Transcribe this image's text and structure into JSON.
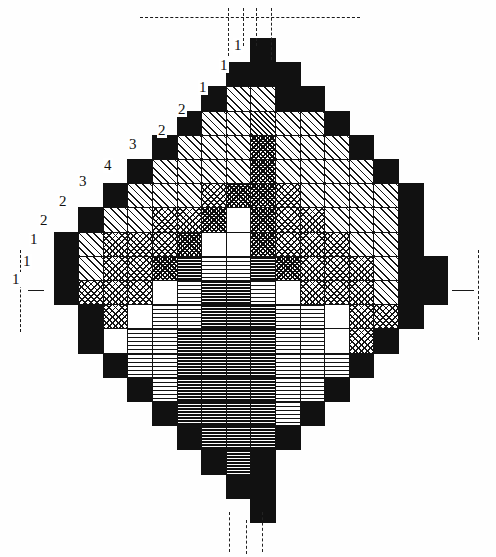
{
  "figure": {
    "kind": "reactor-core-cross-section",
    "title": "",
    "width": 496,
    "height": 557,
    "background": "#ffffff",
    "ink": "#111111"
  },
  "geometry": {
    "cell_w": 24.6,
    "cell_h": 24.2,
    "origin_x": 29,
    "origin_y": 38,
    "cols": 18,
    "rows": 21
  },
  "legend_patterns": [
    {
      "key": "black",
      "name": "solid-black",
      "css": "p-black"
    },
    {
      "key": "white",
      "name": "blank-white",
      "css": "p-white"
    },
    {
      "key": "diag",
      "name": "diagonal-hatch",
      "css": "p-diag"
    },
    {
      "key": "diag2",
      "name": "dense-diagonal",
      "css": "p-diag2"
    },
    {
      "key": "cross",
      "name": "cross-hatch",
      "css": "p-cross"
    },
    {
      "key": "cross2",
      "name": "dense-cross-hatch",
      "css": "p-cross2"
    },
    {
      "key": "horiz",
      "name": "horizontal-rule",
      "css": "p-horiz"
    },
    {
      "key": "horiz2",
      "name": "dense-horizontal",
      "css": "p-horiz2"
    }
  ],
  "callouts": [
    {
      "label": "1",
      "x": 233,
      "y": 38
    },
    {
      "label": "1",
      "x": 219,
      "y": 58
    },
    {
      "label": "1",
      "x": 198,
      "y": 80
    },
    {
      "label": "2",
      "x": 177,
      "y": 102
    },
    {
      "label": "2",
      "x": 157,
      "y": 123
    },
    {
      "label": "3",
      "x": 128,
      "y": 137
    },
    {
      "label": "4",
      "x": 103,
      "y": 158
    },
    {
      "label": "3",
      "x": 78,
      "y": 174
    },
    {
      "label": "2",
      "x": 58,
      "y": 194
    },
    {
      "label": "2",
      "x": 39,
      "y": 213
    },
    {
      "label": "1",
      "x": 29,
      "y": 232
    },
    {
      "label": "1",
      "x": 22,
      "y": 254
    },
    {
      "label": "1",
      "x": 11,
      "y": 272
    }
  ],
  "centerlines": {
    "top_horizontal": {
      "x": 140,
      "y": 17,
      "w": 220
    },
    "left_vertical": {
      "x": 20,
      "y": 250,
      "h": 82
    },
    "right_vertical": {
      "x": 478,
      "y": 250,
      "h": 90
    },
    "core_vertical_left": {
      "x": 228,
      "y": 8,
      "h": 48
    },
    "core_vertical_mid": {
      "x": 243,
      "y": 8,
      "h": 38
    },
    "core_vertical_mid2": {
      "x": 256,
      "y": 8,
      "h": 38
    },
    "core_vertical_right": {
      "x": 271,
      "y": 8,
      "h": 52
    },
    "bottom_left": {
      "x": 229,
      "y": 512,
      "h": 40
    },
    "bottom_mid": {
      "x": 246,
      "y": 520,
      "h": 34
    },
    "bottom_right": {
      "x": 262,
      "y": 512,
      "h": 40
    },
    "left_tick": {
      "x": 28,
      "y": 290,
      "w": 16
    },
    "right_tick": {
      "x": 452,
      "y": 290,
      "w": 22
    }
  },
  "grid_rows": [
    {
      "row": 0,
      "start_col": 9,
      "patterns": [
        "black"
      ]
    },
    {
      "row": 1,
      "start_col": 8,
      "patterns": [
        "black",
        "black",
        "black"
      ]
    },
    {
      "row": 2,
      "start_col": 7,
      "patterns": [
        "black",
        "diag",
        "diag",
        "black",
        "black"
      ]
    },
    {
      "row": 3,
      "start_col": 6,
      "patterns": [
        "black",
        "diag",
        "diag",
        "diag2",
        "diag",
        "diag",
        "black"
      ]
    },
    {
      "row": 4,
      "start_col": 5,
      "patterns": [
        "black",
        "diag",
        "diag",
        "diag",
        "cross2",
        "diag",
        "diag",
        "diag",
        "black"
      ]
    },
    {
      "row": 5,
      "start_col": 4,
      "patterns": [
        "black",
        "diag",
        "diag",
        "diag",
        "diag",
        "cross2",
        "diag",
        "diag",
        "diag",
        "diag",
        "black"
      ]
    },
    {
      "row": 6,
      "start_col": 3,
      "patterns": [
        "black",
        "diag",
        "diag",
        "diag",
        "cross",
        "cross2",
        "cross2",
        "cross",
        "diag",
        "diag",
        "diag",
        "diag",
        "black"
      ]
    },
    {
      "row": 7,
      "start_col": 2,
      "patterns": [
        "black",
        "diag",
        "diag",
        "cross",
        "cross",
        "cross2",
        "white",
        "cross2",
        "cross",
        "cross",
        "diag",
        "diag",
        "diag",
        "black"
      ]
    },
    {
      "row": 8,
      "start_col": 1,
      "patterns": [
        "black",
        "diag",
        "cross",
        "cross",
        "cross",
        "cross2",
        "white",
        "white",
        "cross2",
        "cross",
        "cross",
        "cross",
        "diag",
        "diag",
        "black"
      ]
    },
    {
      "row": 9,
      "start_col": 1,
      "patterns": [
        "black",
        "diag",
        "cross",
        "cross",
        "cross2",
        "horiz2",
        "horiz",
        "horiz",
        "horiz2",
        "cross2",
        "cross",
        "cross",
        "cross",
        "diag",
        "black",
        "black"
      ]
    },
    {
      "row": 10,
      "start_col": 1,
      "patterns": [
        "black",
        "cross",
        "cross",
        "cross",
        "white",
        "horiz",
        "horiz2",
        "horiz2",
        "horiz",
        "white",
        "cross",
        "cross",
        "cross",
        "diag",
        "black",
        "black"
      ]
    },
    {
      "row": 11,
      "start_col": 2,
      "patterns": [
        "black",
        "cross",
        "white",
        "horiz",
        "horiz",
        "horiz2",
        "horiz2",
        "horiz2",
        "horiz",
        "horiz",
        "white",
        "cross",
        "cross",
        "black"
      ]
    },
    {
      "row": 12,
      "start_col": 2,
      "patterns": [
        "black",
        "white",
        "horiz",
        "horiz",
        "horiz2",
        "horiz2",
        "horiz2",
        "horiz2",
        "horiz",
        "horiz",
        "white",
        "cross",
        "black"
      ]
    },
    {
      "row": 13,
      "start_col": 3,
      "patterns": [
        "black",
        "horiz",
        "horiz",
        "horiz2",
        "horiz2",
        "horiz2",
        "horiz2",
        "horiz",
        "horiz",
        "horiz",
        "black"
      ]
    },
    {
      "row": 14,
      "start_col": 4,
      "patterns": [
        "black",
        "horiz",
        "horiz2",
        "horiz2",
        "horiz2",
        "horiz2",
        "horiz",
        "horiz",
        "black"
      ]
    },
    {
      "row": 15,
      "start_col": 5,
      "patterns": [
        "black",
        "horiz2",
        "horiz2",
        "horiz2",
        "horiz2",
        "horiz",
        "black"
      ]
    },
    {
      "row": 16,
      "start_col": 6,
      "patterns": [
        "black",
        "horiz2",
        "horiz2",
        "horiz2",
        "black"
      ]
    },
    {
      "row": 17,
      "start_col": 7,
      "patterns": [
        "black",
        "horiz2",
        "black"
      ]
    },
    {
      "row": 18,
      "start_col": 8,
      "patterns": [
        "black",
        "black"
      ]
    },
    {
      "row": 19,
      "start_col": 9,
      "patterns": [
        "black"
      ]
    }
  ]
}
